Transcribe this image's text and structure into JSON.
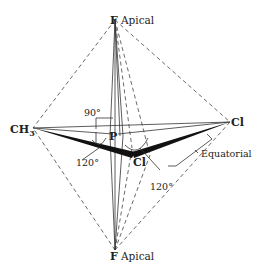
{
  "diagram": {
    "atoms": {
      "top_F": "F",
      "bottom_F": "F",
      "center_P": "P",
      "methyl": "CH",
      "methyl_sub": "3",
      "cl_right": "Cl",
      "cl_front": "Cl"
    },
    "labels": {
      "apical_top": "Apical",
      "apical_bottom": "Apical",
      "equatorial": "Equatorial",
      "angle_90": "90°",
      "angle_120_left": "120°",
      "angle_120_right": "120°"
    },
    "colors": {
      "line": "#333333",
      "wedge": "#111111",
      "text": "#222222"
    }
  }
}
